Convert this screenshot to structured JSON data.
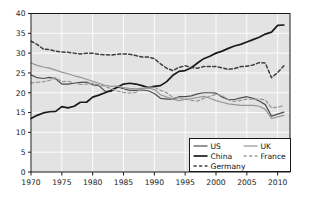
{
  "chart_data": {
    "type": "line",
    "title": "",
    "subtitle": "",
    "xlabel": "",
    "ylabel": "",
    "xlim": [
      1970,
      2012
    ],
    "ylim": [
      0,
      40
    ],
    "xticks": [
      1970,
      1975,
      1980,
      1985,
      1990,
      1995,
      2000,
      2005,
      2010
    ],
    "yticks": [
      0,
      5,
      10,
      15,
      20,
      25,
      30,
      35,
      40
    ],
    "xtick_labels": [
      "1970",
      "1975",
      "1980",
      "1985",
      "1990",
      "1995",
      "2000",
      "2005",
      "2010"
    ],
    "ytick_labels": [
      "0",
      "5",
      "10",
      "15",
      "20",
      "25",
      "30",
      "35",
      "40"
    ],
    "grid": true,
    "grid_color": "#ffffff",
    "plot_background": "#e3e3e3",
    "figure_background": "#ffffff",
    "legend_position": "lower right",
    "x": [
      1970,
      1971,
      1972,
      1973,
      1974,
      1975,
      1976,
      1977,
      1978,
      1979,
      1980,
      1981,
      1982,
      1983,
      1984,
      1985,
      1986,
      1987,
      1988,
      1989,
      1990,
      1991,
      1992,
      1993,
      1994,
      1995,
      1996,
      1997,
      1998,
      1999,
      2000,
      2001,
      2002,
      2003,
      2004,
      2005,
      2006,
      2007,
      2008,
      2009,
      2010,
      2011
    ],
    "series": [
      {
        "name": "US",
        "color": "#4d4d4d",
        "linestyle": "solid",
        "linewidth": 1.2,
        "values": [
          24.5,
          23.8,
          23.6,
          23.9,
          23.5,
          22.2,
          22.2,
          22.4,
          22.6,
          22.7,
          22.0,
          21.8,
          20.4,
          20.3,
          21.5,
          21.0,
          20.6,
          20.6,
          20.7,
          20.5,
          19.8,
          18.6,
          18.4,
          18.4,
          19.0,
          19.0,
          19.2,
          19.7,
          20.0,
          20.0,
          19.9,
          18.9,
          18.3,
          18.3,
          18.7,
          19.0,
          18.6,
          17.9,
          17.0,
          14.1,
          14.6,
          15.1
        ]
      },
      {
        "name": "China",
        "color": "#1a1a1a",
        "linestyle": "solid",
        "linewidth": 1.7,
        "values": [
          13.5,
          14.3,
          14.9,
          15.2,
          15.3,
          16.5,
          16.2,
          16.6,
          17.6,
          17.6,
          18.9,
          19.4,
          20.0,
          20.6,
          21.4,
          22.2,
          22.4,
          22.2,
          21.8,
          21.3,
          21.6,
          21.8,
          22.8,
          24.4,
          25.4,
          25.6,
          26.3,
          27.5,
          28.6,
          29.2,
          30.0,
          30.5,
          31.2,
          31.8,
          32.2,
          32.8,
          33.4,
          34.0,
          34.8,
          35.3,
          37.0,
          37.1
        ]
      },
      {
        "name": "Germany",
        "color": "#3d3d3d",
        "linestyle": "dashed",
        "linewidth": 1.5,
        "values": [
          33.0,
          32.2,
          31.0,
          30.9,
          30.5,
          30.3,
          30.2,
          30.0,
          29.8,
          30.0,
          30.0,
          29.7,
          29.6,
          29.5,
          29.7,
          29.8,
          29.7,
          29.4,
          29.0,
          29.0,
          28.6,
          27.3,
          26.2,
          25.6,
          26.4,
          26.8,
          26.4,
          26.2,
          26.6,
          26.6,
          26.6,
          26.3,
          25.9,
          26.1,
          26.6,
          26.7,
          27.0,
          27.6,
          27.5,
          23.8,
          25.1,
          26.8
        ]
      },
      {
        "name": "UK",
        "color": "#969696",
        "linestyle": "solid",
        "linewidth": 1.2,
        "values": [
          27.5,
          26.9,
          26.5,
          26.2,
          25.7,
          25.2,
          24.8,
          24.3,
          23.9,
          23.4,
          22.9,
          22.4,
          21.9,
          21.6,
          21.7,
          21.3,
          21.1,
          21.0,
          21.1,
          21.2,
          20.8,
          19.5,
          18.9,
          18.4,
          18.0,
          18.3,
          18.5,
          18.8,
          19.1,
          18.6,
          18.0,
          17.6,
          17.2,
          17.0,
          16.8,
          16.8,
          16.8,
          16.6,
          15.8,
          13.5,
          13.9,
          14.3
        ]
      },
      {
        "name": "France",
        "color": "#9a9a9a",
        "linestyle": "dashed",
        "linewidth": 1.3,
        "values": [
          22.5,
          22.6,
          22.8,
          23.1,
          23.8,
          22.8,
          22.9,
          22.5,
          22.1,
          22.2,
          22.4,
          22.0,
          21.6,
          21.0,
          20.4,
          20.1,
          19.9,
          20.1,
          20.9,
          21.4,
          21.4,
          20.6,
          20.0,
          18.8,
          18.6,
          18.5,
          18.1,
          17.9,
          18.6,
          19.1,
          19.6,
          19.3,
          18.2,
          17.8,
          18.1,
          18.4,
          18.4,
          18.4,
          18.2,
          16.2,
          16.4,
          16.7
        ]
      }
    ]
  },
  "legend": {
    "entries": [
      {
        "label": "US",
        "key": "us"
      },
      {
        "label": "UK",
        "key": "uk"
      },
      {
        "label": "China",
        "key": "china"
      },
      {
        "label": "France",
        "key": "france"
      },
      {
        "label": "Germany",
        "key": "germany"
      }
    ]
  }
}
